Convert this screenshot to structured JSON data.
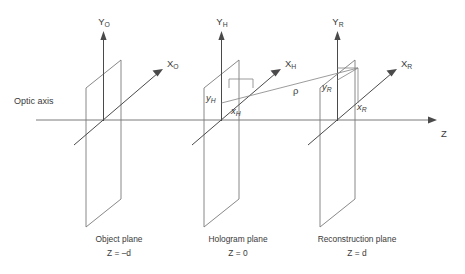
{
  "figure": {
    "background_color": "#ffffff",
    "line_color": "#6b6b6b",
    "text_color": "#3a3a3a"
  },
  "axes": {
    "optic_axis_label": "Optic axis",
    "z_axis_label": "Z"
  },
  "planes": [
    {
      "id": "object",
      "y_axis_label": "Y",
      "y_axis_sub": "O",
      "x_axis_label": "X",
      "x_axis_sub": "O",
      "caption_name": "Object plane",
      "caption_coord": "Z = –d"
    },
    {
      "id": "hologram",
      "y_axis_label": "Y",
      "y_axis_sub": "H",
      "x_axis_label": "X",
      "x_axis_sub": "H",
      "caption_name": "Hologram plane",
      "caption_coord": "Z = 0",
      "point_x_label": "x",
      "point_x_sub": "H",
      "point_y_label": "y",
      "point_y_sub": "H"
    },
    {
      "id": "reconstruction",
      "y_axis_label": "Y",
      "y_axis_sub": "R",
      "x_axis_label": "X",
      "x_axis_sub": "R",
      "caption_name": "Reconstruction plane",
      "caption_coord": "Z = d",
      "point_x_label": "x",
      "point_x_sub": "R",
      "point_y_label": "y",
      "point_y_sub": "R"
    }
  ],
  "annotations": {
    "rho_label": "ρ"
  }
}
